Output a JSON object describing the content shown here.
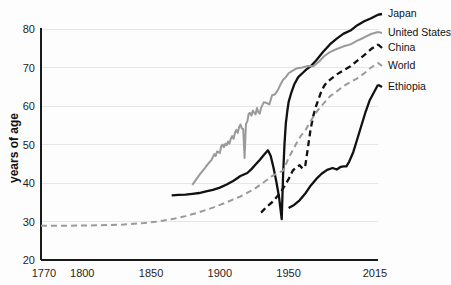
{
  "chart_data": {
    "type": "line",
    "title": "",
    "subtitle": "",
    "xlabel": "",
    "ylabel": "years of age",
    "xlim": [
      1770,
      2015
    ],
    "ylim": [
      20,
      80
    ],
    "grid": true,
    "grid_axis": "y",
    "legend_position": "right-inline",
    "x_ticks": [
      1770,
      1800,
      1850,
      1900,
      1950,
      2015
    ],
    "x_tick_labels": [
      "1770",
      "1800",
      "1850",
      "1900",
      "1950",
      "2015"
    ],
    "y_ticks": [
      20,
      30,
      40,
      50,
      60,
      70,
      80
    ],
    "y_tick_labels": [
      "20",
      "30",
      "40",
      "50",
      "60",
      "70",
      "80"
    ],
    "series": [
      {
        "name": "Japan",
        "color": "#111111",
        "style": "solid",
        "width": 2.3,
        "label_x": 388,
        "label_y": 14,
        "points": [
          [
            1865,
            36.8
          ],
          [
            1870,
            36.9
          ],
          [
            1875,
            37.0
          ],
          [
            1880,
            37.2
          ],
          [
            1885,
            37.4
          ],
          [
            1890,
            37.8
          ],
          [
            1895,
            38.2
          ],
          [
            1900,
            38.8
          ],
          [
            1905,
            39.6
          ],
          [
            1910,
            40.6
          ],
          [
            1915,
            41.8
          ],
          [
            1920,
            42.6
          ],
          [
            1923,
            43.6
          ],
          [
            1926,
            44.8
          ],
          [
            1929,
            46.0
          ],
          [
            1932,
            47.3
          ],
          [
            1935,
            48.5
          ],
          [
            1937,
            47.0
          ],
          [
            1939,
            44.0
          ],
          [
            1941,
            40.5
          ],
          [
            1943,
            36.5
          ],
          [
            1945,
            30.6
          ],
          [
            1946,
            42.0
          ],
          [
            1947,
            50.0
          ],
          [
            1948,
            55.5
          ],
          [
            1949,
            58.5
          ],
          [
            1950,
            61.0
          ],
          [
            1952,
            63.5
          ],
          [
            1954,
            65.5
          ],
          [
            1957,
            67.5
          ],
          [
            1960,
            68.5
          ],
          [
            1963,
            69.5
          ],
          [
            1966,
            70.3
          ],
          [
            1970,
            71.8
          ],
          [
            1975,
            74.0
          ],
          [
            1980,
            76.0
          ],
          [
            1985,
            77.5
          ],
          [
            1990,
            78.8
          ],
          [
            1995,
            79.6
          ],
          [
            2000,
            81.0
          ],
          [
            2005,
            82.0
          ],
          [
            2010,
            82.8
          ],
          [
            2015,
            83.7
          ]
        ]
      },
      {
        "name": "United States",
        "color": "#9a9a9a",
        "style": "solid",
        "width": 2.0,
        "label_x": 388,
        "label_y": 33,
        "points": [
          [
            1880,
            39.5
          ],
          [
            1883,
            41.0
          ],
          [
            1886,
            42.5
          ],
          [
            1889,
            43.8
          ],
          [
            1892,
            45.2
          ],
          [
            1894,
            46.0
          ],
          [
            1896,
            47.5
          ],
          [
            1897,
            47.0
          ],
          [
            1898,
            48.2
          ],
          [
            1900,
            47.8
          ],
          [
            1901,
            49.5
          ],
          [
            1902,
            50.0
          ],
          [
            1903,
            49.3
          ],
          [
            1904,
            50.2
          ],
          [
            1905,
            49.8
          ],
          [
            1906,
            50.8
          ],
          [
            1907,
            50.2
          ],
          [
            1908,
            51.5
          ],
          [
            1909,
            52.2
          ],
          [
            1910,
            51.5
          ],
          [
            1911,
            53.0
          ],
          [
            1912,
            53.8
          ],
          [
            1913,
            53.0
          ],
          [
            1914,
            54.5
          ],
          [
            1915,
            55.2
          ],
          [
            1916,
            54.2
          ],
          [
            1917,
            54.0
          ],
          [
            1918,
            46.5
          ],
          [
            1919,
            55.3
          ],
          [
            1920,
            56.0
          ],
          [
            1921,
            58.0
          ],
          [
            1922,
            58.2
          ],
          [
            1923,
            57.5
          ],
          [
            1924,
            58.8
          ],
          [
            1925,
            58.3
          ],
          [
            1926,
            57.8
          ],
          [
            1927,
            59.5
          ],
          [
            1928,
            58.4
          ],
          [
            1929,
            58.0
          ],
          [
            1930,
            59.5
          ],
          [
            1932,
            61.0
          ],
          [
            1934,
            60.8
          ],
          [
            1936,
            60.4
          ],
          [
            1938,
            62.8
          ],
          [
            1940,
            63.0
          ],
          [
            1942,
            64.0
          ],
          [
            1944,
            65.5
          ],
          [
            1946,
            66.8
          ],
          [
            1948,
            67.5
          ],
          [
            1950,
            68.5
          ],
          [
            1953,
            69.2
          ],
          [
            1956,
            69.8
          ],
          [
            1960,
            70.0
          ],
          [
            1964,
            70.4
          ],
          [
            1968,
            70.3
          ],
          [
            1972,
            71.5
          ],
          [
            1976,
            73.0
          ],
          [
            1980,
            74.0
          ],
          [
            1985,
            74.8
          ],
          [
            1990,
            75.5
          ],
          [
            1995,
            76.0
          ],
          [
            2000,
            77.0
          ],
          [
            2005,
            77.8
          ],
          [
            2010,
            78.7
          ],
          [
            2015,
            79.2
          ]
        ]
      },
      {
        "name": "China",
        "color": "#111111",
        "style": "dashed",
        "width": 2.3,
        "dash": "6,4",
        "label_x": 388,
        "label_y": 48,
        "points": [
          [
            1930,
            32.3
          ],
          [
            1934,
            33.8
          ],
          [
            1938,
            35.0
          ],
          [
            1941,
            36.2
          ],
          [
            1944,
            37.5
          ],
          [
            1947,
            39.2
          ],
          [
            1950,
            41.0
          ],
          [
            1953,
            43.2
          ],
          [
            1956,
            44.2
          ],
          [
            1958,
            44.6
          ],
          [
            1960,
            43.8
          ],
          [
            1962,
            44.2
          ],
          [
            1964,
            49.0
          ],
          [
            1966,
            54.0
          ],
          [
            1968,
            57.5
          ],
          [
            1970,
            60.0
          ],
          [
            1972,
            62.0
          ],
          [
            1974,
            64.0
          ],
          [
            1976,
            65.3
          ],
          [
            1978,
            66.2
          ],
          [
            1980,
            66.8
          ],
          [
            1985,
            68.2
          ],
          [
            1990,
            69.3
          ],
          [
            1995,
            70.3
          ],
          [
            2000,
            71.8
          ],
          [
            2005,
            73.2
          ],
          [
            2010,
            74.8
          ],
          [
            2015,
            76.0
          ]
        ]
      },
      {
        "name": "World",
        "color": "#9a9a9a",
        "style": "dashed",
        "width": 2.0,
        "dash": "6,4",
        "label_x": 388,
        "label_y": 66,
        "points": [
          [
            1770,
            28.9
          ],
          [
            1790,
            28.9
          ],
          [
            1810,
            29.0
          ],
          [
            1830,
            29.2
          ],
          [
            1845,
            29.6
          ],
          [
            1855,
            30.0
          ],
          [
            1865,
            30.6
          ],
          [
            1875,
            31.4
          ],
          [
            1885,
            32.4
          ],
          [
            1895,
            33.6
          ],
          [
            1905,
            35.0
          ],
          [
            1915,
            36.5
          ],
          [
            1925,
            38.4
          ],
          [
            1932,
            40.2
          ],
          [
            1938,
            41.8
          ],
          [
            1942,
            42.6
          ],
          [
            1946,
            43.2
          ],
          [
            1950,
            46.5
          ],
          [
            1953,
            48.5
          ],
          [
            1956,
            50.5
          ],
          [
            1959,
            52.3
          ],
          [
            1962,
            53.5
          ],
          [
            1965,
            55.5
          ],
          [
            1968,
            57.2
          ],
          [
            1971,
            58.8
          ],
          [
            1975,
            60.5
          ],
          [
            1980,
            62.5
          ],
          [
            1985,
            63.8
          ],
          [
            1990,
            65.2
          ],
          [
            1995,
            66.2
          ],
          [
            2000,
            67.2
          ],
          [
            2005,
            68.5
          ],
          [
            2010,
            70.0
          ],
          [
            2015,
            71.2
          ]
        ]
      },
      {
        "name": "Ethiopia",
        "color": "#111111",
        "style": "solid",
        "width": 2.3,
        "label_x": 388,
        "label_y": 87,
        "points": [
          [
            1950,
            33.5
          ],
          [
            1954,
            34.3
          ],
          [
            1958,
            35.5
          ],
          [
            1962,
            37.2
          ],
          [
            1966,
            39.3
          ],
          [
            1970,
            41.0
          ],
          [
            1974,
            42.4
          ],
          [
            1978,
            43.4
          ],
          [
            1982,
            43.9
          ],
          [
            1985,
            43.5
          ],
          [
            1988,
            44.2
          ],
          [
            1990,
            44.3
          ],
          [
            1992,
            44.3
          ],
          [
            1994,
            45.5
          ],
          [
            1997,
            48.0
          ],
          [
            2000,
            51.5
          ],
          [
            2003,
            55.0
          ],
          [
            2006,
            58.5
          ],
          [
            2009,
            61.5
          ],
          [
            2012,
            63.5
          ],
          [
            2015,
            65.5
          ]
        ]
      }
    ],
    "annotations": [
      {
        "name": "us-1918-flu-dip",
        "year": 1918,
        "value": 46.5
      },
      {
        "name": "japan-ww2-collapse",
        "year": 1945,
        "value": 30.6
      },
      {
        "name": "china-great-leap-dip",
        "year": 1960,
        "value": 43.8
      }
    ]
  },
  "axes": {
    "y_axis_title": "years of age"
  }
}
